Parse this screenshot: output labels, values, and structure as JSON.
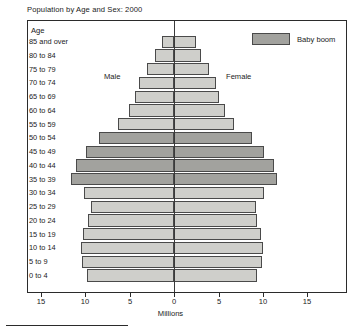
{
  "chart_title": "Population by Age and Sex:  2000",
  "axis_caption": "Age",
  "annotations": {
    "male": "Male",
    "female": "Female"
  },
  "legend": {
    "label": "Baby boom",
    "swatch_color": "#a2a29e"
  },
  "colors": {
    "bar_light": "#cfcfcb",
    "bar_dark": "#a2a29e",
    "bar_border": "#4a4a4a",
    "frame": "#2b2b2b",
    "text": "#1a1a1a"
  },
  "xaxis": {
    "title": "Millions",
    "ticks": [
      "15",
      "10",
      "5",
      "0",
      "5",
      "10",
      "15"
    ],
    "tick_positions_px": [
      41,
      85,
      130,
      174,
      219,
      263,
      307
    ],
    "range_millions": [
      15,
      15
    ],
    "px_per_million": 8.87,
    "zero_px": 174
  },
  "chart_data": {
    "type": "bar",
    "title": "Population by Age and Sex:  2000",
    "xlabel": "Millions",
    "ylabel": "Age",
    "xlim": [
      -15,
      15
    ],
    "grid": false,
    "legend_position": "top-right",
    "categories": [
      "85 and over",
      "80 to 84",
      "75 to 79",
      "70 to 74",
      "65 to 69",
      "60 to 64",
      "55 to 59",
      "50 to 54",
      "45 to 49",
      "40 to 44",
      "35 to 39",
      "30 to 34",
      "25 to 29",
      "20 to 24",
      "15 to 19",
      "10 to 14",
      "5 to 9",
      "0 to 4"
    ],
    "series": [
      {
        "name": "Male",
        "values": [
          1.4,
          2.1,
          3.0,
          3.9,
          4.4,
          5.1,
          6.3,
          8.4,
          9.9,
          11.1,
          11.6,
          10.2,
          9.4,
          9.7,
          10.3,
          10.5,
          10.4,
          9.8
        ]
      },
      {
        "name": "Female",
        "values": [
          2.5,
          3.1,
          4.0,
          4.7,
          5.1,
          5.7,
          6.8,
          8.8,
          10.2,
          11.3,
          11.6,
          10.2,
          9.3,
          9.4,
          9.8,
          10.0,
          9.9,
          9.4
        ]
      }
    ],
    "highlight": {
      "label": "Baby boom",
      "categories": [
        "35 to 39",
        "40 to 44",
        "45 to 49",
        "50 to 54"
      ]
    }
  },
  "rows": [
    {
      "label": "85 and over",
      "male": 1.4,
      "female": 2.5,
      "boom": false
    },
    {
      "label": "80 to 84",
      "male": 2.1,
      "female": 3.1,
      "boom": false
    },
    {
      "label": "75 to 79",
      "male": 3.0,
      "female": 4.0,
      "boom": false
    },
    {
      "label": "70 to 74",
      "male": 3.9,
      "female": 4.7,
      "boom": false
    },
    {
      "label": "65 to 69",
      "male": 4.4,
      "female": 5.1,
      "boom": false
    },
    {
      "label": "60 to 64",
      "male": 5.1,
      "female": 5.7,
      "boom": false
    },
    {
      "label": "55 to 59",
      "male": 6.3,
      "female": 6.8,
      "boom": false
    },
    {
      "label": "50 to 54",
      "male": 8.4,
      "female": 8.8,
      "boom": true
    },
    {
      "label": "45 to 49",
      "male": 9.9,
      "female": 10.2,
      "boom": true
    },
    {
      "label": "40 to 44",
      "male": 11.1,
      "female": 11.3,
      "boom": true
    },
    {
      "label": "35 to 39",
      "male": 11.6,
      "female": 11.6,
      "boom": true
    },
    {
      "label": "30 to 34",
      "male": 10.2,
      "female": 10.2,
      "boom": false
    },
    {
      "label": "25 to 29",
      "male": 9.4,
      "female": 9.3,
      "boom": false
    },
    {
      "label": "20 to 24",
      "male": 9.7,
      "female": 9.4,
      "boom": false
    },
    {
      "label": "15 to 19",
      "male": 10.3,
      "female": 9.8,
      "boom": false
    },
    {
      "label": "10 to 14",
      "male": 10.5,
      "female": 10.0,
      "boom": false
    },
    {
      "label": "5 to 9",
      "male": 10.4,
      "female": 9.9,
      "boom": false
    },
    {
      "label": "0 to 4",
      "male": 9.8,
      "female": 9.4,
      "boom": false
    }
  ]
}
